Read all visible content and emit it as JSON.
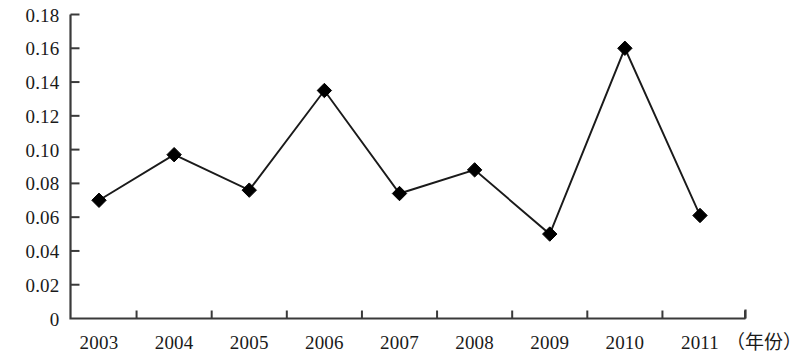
{
  "chart_data": {
    "type": "line",
    "title": "",
    "subtitle": "",
    "xlabel": "（年份）",
    "ylabel": "",
    "categories": [
      "2003",
      "2004",
      "2005",
      "2006",
      "2007",
      "2008",
      "2009",
      "2010",
      "2011"
    ],
    "x": [
      2003,
      2004,
      2005,
      2006,
      2007,
      2008,
      2009,
      2010,
      2011
    ],
    "values": [
      0.07,
      0.097,
      0.076,
      0.135,
      0.074,
      0.088,
      0.05,
      0.16,
      0.061
    ],
    "series": [
      {
        "name": "",
        "values": [
          0.07,
          0.097,
          0.076,
          0.135,
          0.074,
          0.088,
          0.05,
          0.16,
          0.061
        ]
      }
    ],
    "ylim": [
      0,
      0.18
    ],
    "xlim": [
      2003,
      2011
    ],
    "ytick_labels": [
      "0",
      "0.02",
      "0.04",
      "0.06",
      "0.08",
      "0.10",
      "0.12",
      "0.14",
      "0.16",
      "0.18"
    ],
    "ytick_values": [
      0,
      0.02,
      0.04,
      0.06,
      0.08,
      0.1,
      0.12,
      0.14,
      0.16,
      0.18
    ],
    "grid": false,
    "legend": null,
    "legend_position": "none",
    "marker": "diamond",
    "line_color": "#1a1a1a",
    "marker_color": "#000000",
    "axis_color": "#3a3a3a",
    "background_color": "#ffffff",
    "annotations": []
  }
}
